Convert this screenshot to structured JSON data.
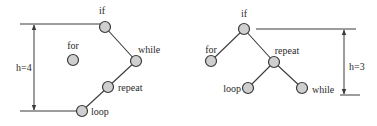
{
  "colors": {
    "node_fill": "#cfcfcf",
    "stroke": "#3a3a3a",
    "text": "#2a2a2a",
    "background": "#ffffff"
  },
  "left_tree": {
    "height_label": "h=4",
    "nodes": [
      {
        "id": "if",
        "label": "if",
        "x": 105,
        "y": 27,
        "lx": 102,
        "ly": 14,
        "anchor": "middle"
      },
      {
        "id": "for",
        "label": "for",
        "x": 73,
        "y": 60,
        "lx": 73,
        "ly": 49,
        "anchor": "middle"
      },
      {
        "id": "while",
        "label": "while",
        "x": 136,
        "y": 61,
        "lx": 138,
        "ly": 53,
        "anchor": "start"
      },
      {
        "id": "repeat",
        "label": "repeat",
        "x": 108,
        "y": 87,
        "lx": 118,
        "ly": 91,
        "anchor": "start"
      },
      {
        "id": "loop",
        "label": "loop",
        "x": 82,
        "y": 111,
        "lx": 91,
        "ly": 115,
        "anchor": "start"
      }
    ],
    "edges": [
      [
        "if",
        "while"
      ],
      [
        "while",
        "repeat"
      ],
      [
        "repeat",
        "loop"
      ]
    ],
    "measure": {
      "top_y": 24,
      "bottom_y": 111,
      "arrow_x": 34,
      "top_x1": 20,
      "top_x2": 100,
      "bot_x1": 20,
      "bot_x2": 77,
      "label_x": 16,
      "label_y": 71
    }
  },
  "right_tree": {
    "height_label": "h=3",
    "nodes": [
      {
        "id": "if",
        "label": "if",
        "x": 244,
        "y": 29,
        "lx": 244,
        "ly": 17,
        "anchor": "middle"
      },
      {
        "id": "for",
        "label": "for",
        "x": 211,
        "y": 61,
        "lx": 211,
        "ly": 53,
        "anchor": "middle"
      },
      {
        "id": "repeat",
        "label": "repeat",
        "x": 274,
        "y": 62,
        "lx": 287,
        "ly": 54,
        "anchor": "middle"
      },
      {
        "id": "loop",
        "label": "loop",
        "x": 248,
        "y": 88,
        "lx": 241,
        "ly": 92,
        "anchor": "end"
      },
      {
        "id": "while",
        "label": "while",
        "x": 302,
        "y": 88,
        "lx": 312,
        "ly": 93,
        "anchor": "start"
      }
    ],
    "edges": [
      [
        "if",
        "for"
      ],
      [
        "if",
        "repeat"
      ],
      [
        "repeat",
        "loop"
      ],
      [
        "repeat",
        "while"
      ]
    ],
    "measure": {
      "top_y": 29,
      "bottom_y": 95,
      "arrow_x": 344,
      "top_x1": 256,
      "top_x2": 356,
      "bot_x1": 340,
      "bot_x2": 360,
      "label_x": 349,
      "label_y": 70
    }
  }
}
